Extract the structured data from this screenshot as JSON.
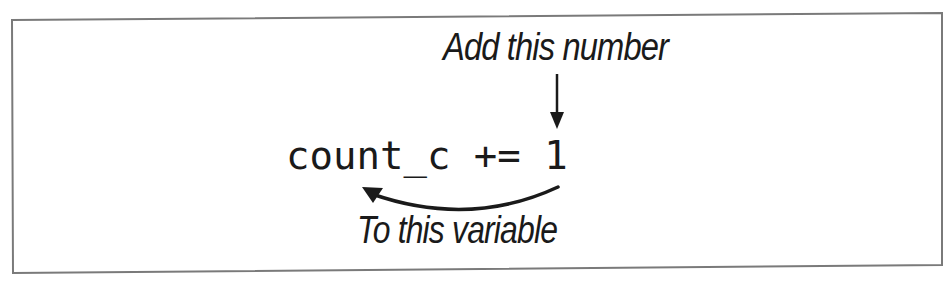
{
  "diagram": {
    "annotation_top": "Add this number",
    "code_line": "count_c += 1",
    "annotation_bottom": "To this variable",
    "arrows": [
      {
        "name": "down-arrow",
        "from": "Add this number",
        "to": "1"
      },
      {
        "name": "curved-arrow",
        "from": "1",
        "to": "count_c"
      }
    ]
  },
  "colors": {
    "border": "#7a7a7a",
    "ink": "#1a1a1a",
    "background": "#ffffff"
  }
}
